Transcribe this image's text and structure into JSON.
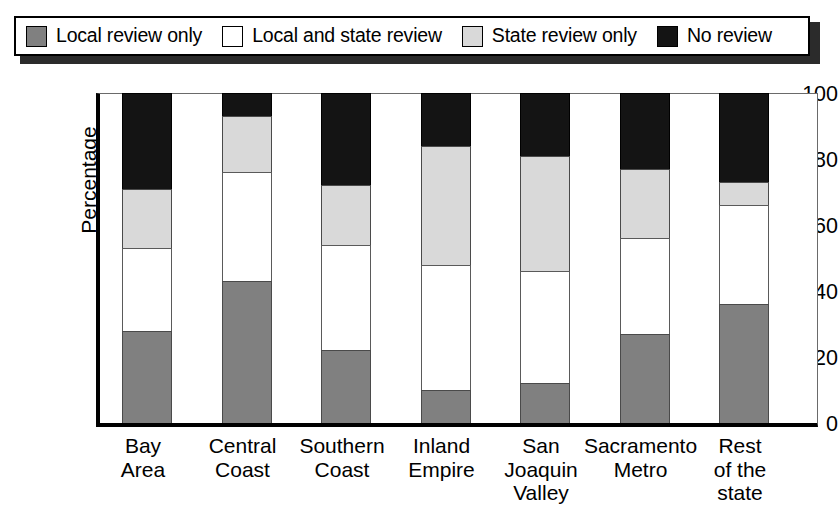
{
  "legend": {
    "items": [
      {
        "label": "Local review only",
        "color": "#808080",
        "icon": "legend-swatch-gray"
      },
      {
        "label": "Local and state review",
        "color": "#ffffff",
        "icon": "legend-swatch-white"
      },
      {
        "label": "State review only",
        "color": "#d9d9d9",
        "icon": "legend-swatch-lightgray"
      },
      {
        "label": "No review",
        "color": "#141414",
        "icon": "legend-swatch-black"
      }
    ]
  },
  "axes": {
    "ylabel": "Percentage",
    "yticks": [
      "0",
      "20",
      "40",
      "60",
      "80",
      "100"
    ],
    "xlabel": ""
  },
  "chart_data": {
    "type": "bar",
    "subtype": "stacked-vertical-100pct",
    "title": "",
    "xlabel": "",
    "ylabel": "Percentage",
    "ylim": [
      0,
      100
    ],
    "yticks": [
      0,
      20,
      40,
      60,
      80,
      100
    ],
    "grid": false,
    "legend_position": "top",
    "categories": [
      "Bay Area",
      "Central Coast",
      "Southern Coast",
      "Inland Empire",
      "San Joaquin Valley",
      "Sacramento Metro",
      "Rest of the state"
    ],
    "category_lines": [
      [
        "Bay",
        "Area"
      ],
      [
        "Central",
        "Coast"
      ],
      [
        "Southern",
        "Coast"
      ],
      [
        "Inland",
        "Empire"
      ],
      [
        "San",
        "Joaquin",
        "Valley"
      ],
      [
        "Sacramento",
        "Metro"
      ],
      [
        "Rest",
        "of the",
        "state"
      ]
    ],
    "series": [
      {
        "name": "Local review only",
        "color": "#808080",
        "values": [
          28,
          43,
          22,
          10,
          12,
          27,
          36
        ]
      },
      {
        "name": "Local and state review",
        "color": "#ffffff",
        "values": [
          25,
          33,
          32,
          38,
          34,
          29,
          30
        ]
      },
      {
        "name": "State review only",
        "color": "#d9d9d9",
        "values": [
          18,
          17,
          18,
          36,
          35,
          21,
          7
        ]
      },
      {
        "name": "No review",
        "color": "#141414",
        "values": [
          29,
          7,
          28,
          16,
          19,
          23,
          27
        ]
      }
    ]
  }
}
